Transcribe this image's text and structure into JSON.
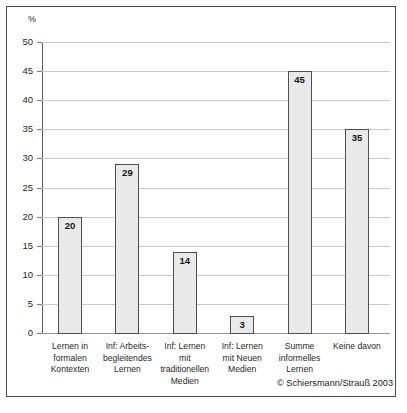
{
  "chart_data": {
    "type": "bar",
    "title": "",
    "subtitle": "",
    "xlabel": "",
    "ylabel": "%",
    "ylim": [
      0,
      50
    ],
    "ytick_step": 5,
    "yticks": [
      0,
      5,
      10,
      15,
      20,
      25,
      30,
      35,
      40,
      45,
      50
    ],
    "grid": true,
    "legend": null,
    "legend_position": "none",
    "categories": [
      "Lernen in formalen Kontexten",
      "Inf: Arbeits- begleitendes Lernen",
      "Inf: Lernen mit traditionellen Medien",
      "Inf: Lernen mit Neuen Medien",
      "Summe informelles Lernen",
      "Keine davon"
    ],
    "category_lines": [
      [
        "Lernen in",
        "formalen",
        "Kontexten"
      ],
      [
        "Inf: Arbeits-",
        "begleitendes",
        "Lernen"
      ],
      [
        "Inf: Lernen",
        "mit",
        "traditionellen",
        "Medien"
      ],
      [
        "Inf: Lernen",
        "mit Neuen",
        "Medien"
      ],
      [
        "Summe",
        "informelles",
        "Lernen"
      ],
      [
        "Keine davon"
      ]
    ],
    "values": [
      20,
      29,
      14,
      3,
      45,
      35
    ],
    "value_labels": [
      "20",
      "29",
      "14",
      "3",
      "45",
      "35"
    ],
    "bar_fill": "#e9e9e9",
    "bar_border": "#4f4f4f",
    "gridline_color": "#c9c9c9",
    "axis_color": "#5a5a5a"
  },
  "axis": {
    "unit": "%",
    "ticks": [
      {
        "label": "50",
        "value": 50
      },
      {
        "label": "45",
        "value": 45
      },
      {
        "label": "40",
        "value": 40
      },
      {
        "label": "35",
        "value": 35
      },
      {
        "label": "30",
        "value": 30
      },
      {
        "label": "25",
        "value": 25
      },
      {
        "label": "20",
        "value": 20
      },
      {
        "label": "15",
        "value": 15
      },
      {
        "label": "10",
        "value": 10
      },
      {
        "label": "5",
        "value": 5
      },
      {
        "label": "0",
        "value": 0
      }
    ]
  },
  "credit": "© Schiersmann/Strauß 2003"
}
